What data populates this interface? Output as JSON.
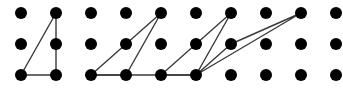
{
  "figure": {
    "canvas": {
      "width": 343,
      "height": 88,
      "background": "#ffffff"
    },
    "style": {
      "dot_color": "#000000",
      "dot_radius": 6,
      "line_color": "#3a3a3a",
      "line_width": 1.4
    }
  },
  "chart_data": {
    "type": "scatter",
    "xlabel": "",
    "ylabel": "",
    "grid": false,
    "legend": null,
    "axis": {
      "columns": 10,
      "rows": 3,
      "column_spacing_px": 35,
      "row_spacing_px": 31,
      "origin_px": {
        "x": 21,
        "y": 13
      }
    },
    "column_x": [
      21,
      56,
      91,
      126,
      161,
      196,
      231,
      266,
      301,
      336
    ],
    "row_y": [
      13,
      44,
      75
    ],
    "points": [
      {
        "col": 0,
        "row": 0,
        "x": 21,
        "y": 13
      },
      {
        "col": 1,
        "row": 0,
        "x": 56,
        "y": 13
      },
      {
        "col": 2,
        "row": 0,
        "x": 91,
        "y": 13
      },
      {
        "col": 3,
        "row": 0,
        "x": 126,
        "y": 13
      },
      {
        "col": 4,
        "row": 0,
        "x": 161,
        "y": 13
      },
      {
        "col": 5,
        "row": 0,
        "x": 196,
        "y": 13
      },
      {
        "col": 6,
        "row": 0,
        "x": 231,
        "y": 13
      },
      {
        "col": 7,
        "row": 0,
        "x": 266,
        "y": 13
      },
      {
        "col": 8,
        "row": 0,
        "x": 301,
        "y": 13
      },
      {
        "col": 9,
        "row": 0,
        "x": 336,
        "y": 13
      },
      {
        "col": 0,
        "row": 1,
        "x": 21,
        "y": 44
      },
      {
        "col": 1,
        "row": 1,
        "x": 56,
        "y": 44
      },
      {
        "col": 2,
        "row": 1,
        "x": 91,
        "y": 44
      },
      {
        "col": 3,
        "row": 1,
        "x": 126,
        "y": 44
      },
      {
        "col": 4,
        "row": 1,
        "x": 161,
        "y": 44
      },
      {
        "col": 5,
        "row": 1,
        "x": 196,
        "y": 44
      },
      {
        "col": 6,
        "row": 1,
        "x": 231,
        "y": 44
      },
      {
        "col": 7,
        "row": 1,
        "x": 266,
        "y": 44
      },
      {
        "col": 8,
        "row": 1,
        "x": 301,
        "y": 44
      },
      {
        "col": 9,
        "row": 1,
        "x": 336,
        "y": 44
      },
      {
        "col": 0,
        "row": 2,
        "x": 21,
        "y": 75
      },
      {
        "col": 1,
        "row": 2,
        "x": 56,
        "y": 75
      },
      {
        "col": 2,
        "row": 2,
        "x": 91,
        "y": 75
      },
      {
        "col": 3,
        "row": 2,
        "x": 126,
        "y": 75
      },
      {
        "col": 4,
        "row": 2,
        "x": 161,
        "y": 75
      },
      {
        "col": 5,
        "row": 2,
        "x": 196,
        "y": 75
      },
      {
        "col": 6,
        "row": 2,
        "x": 231,
        "y": 75
      },
      {
        "col": 7,
        "row": 2,
        "x": 266,
        "y": 75
      },
      {
        "col": 8,
        "row": 2,
        "x": 301,
        "y": 75
      },
      {
        "col": 9,
        "row": 2,
        "x": 336,
        "y": 75
      }
    ],
    "polygons": [
      {
        "name": "triangle-1",
        "vertices_grid": [
          [
            0,
            2
          ],
          [
            1,
            0
          ],
          [
            1,
            2
          ]
        ],
        "vertices_px": [
          [
            21,
            75
          ],
          [
            56,
            13
          ],
          [
            56,
            75
          ]
        ],
        "closed": true
      },
      {
        "name": "triangle-2",
        "vertices_grid": [
          [
            2,
            2
          ],
          [
            4,
            0
          ],
          [
            3,
            2
          ]
        ],
        "vertices_px": [
          [
            91,
            75
          ],
          [
            161,
            13
          ],
          [
            126,
            75
          ]
        ],
        "closed": true
      },
      {
        "name": "triangle-3",
        "vertices_grid": [
          [
            4,
            2
          ],
          [
            6,
            0
          ],
          [
            5,
            2
          ]
        ],
        "vertices_px": [
          [
            161,
            75
          ],
          [
            231,
            13
          ],
          [
            196,
            75
          ]
        ],
        "closed": true
      },
      {
        "name": "triangle-4",
        "vertices_grid": [
          [
            5,
            2
          ],
          [
            8,
            0
          ],
          [
            6,
            1
          ]
        ],
        "vertices_px": [
          [
            196,
            75
          ],
          [
            301,
            13
          ],
          [
            231,
            44
          ]
        ],
        "closed": true
      }
    ],
    "extra_segments": [
      {
        "name": "baseline-middle",
        "from_px": [
          91,
          75
        ],
        "to_px": [
          196,
          75
        ]
      }
    ]
  }
}
